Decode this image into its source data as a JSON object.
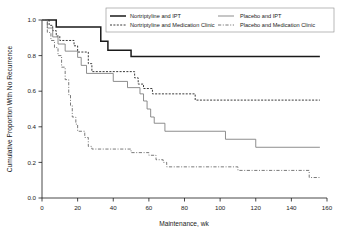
{
  "chart_data": {
    "type": "line",
    "subtype": "kaplan-meier-step",
    "title": "",
    "xlabel": "Maintenance, wk",
    "ylabel": "Cumulative Proportion With No Recurrence",
    "xlim": [
      0,
      160
    ],
    "ylim": [
      0.0,
      1.0
    ],
    "xticks": [
      0,
      20,
      40,
      60,
      80,
      100,
      120,
      140,
      160
    ],
    "xtick_labels": [
      "0",
      "20",
      "40",
      "60",
      "80",
      "100",
      "120",
      "140",
      "160"
    ],
    "yticks": [
      0.0,
      0.2,
      0.4,
      0.6,
      0.8,
      1.0
    ],
    "ytick_labels": [
      "0.0",
      "0.2",
      "0.4",
      "0.6",
      "0.8",
      "1.0"
    ],
    "grid": false,
    "legend_position": "top-center",
    "series": [
      {
        "name": "Nortriptyline and IPT",
        "style": "solid-thick",
        "color": "#1a1a1a",
        "points": [
          [
            0,
            1.0
          ],
          [
            8,
            1.0
          ],
          [
            8,
            0.96
          ],
          [
            33,
            0.96
          ],
          [
            33,
            0.88
          ],
          [
            37,
            0.88
          ],
          [
            37,
            0.83
          ],
          [
            50,
            0.83
          ],
          [
            50,
            0.795
          ],
          [
            156,
            0.795
          ]
        ]
      },
      {
        "name": "Nortriptyline and Medication Clinic",
        "style": "dotted",
        "color": "#3a3a3a",
        "points": [
          [
            0,
            1.0
          ],
          [
            4,
            1.0
          ],
          [
            4,
            0.97
          ],
          [
            6,
            0.97
          ],
          [
            6,
            0.94
          ],
          [
            8,
            0.94
          ],
          [
            8,
            0.91
          ],
          [
            10,
            0.91
          ],
          [
            10,
            0.885
          ],
          [
            18,
            0.885
          ],
          [
            18,
            0.855
          ],
          [
            20,
            0.855
          ],
          [
            20,
            0.82
          ],
          [
            26,
            0.82
          ],
          [
            26,
            0.755
          ],
          [
            28,
            0.755
          ],
          [
            28,
            0.71
          ],
          [
            52,
            0.71
          ],
          [
            52,
            0.675
          ],
          [
            54,
            0.675
          ],
          [
            54,
            0.64
          ],
          [
            57,
            0.64
          ],
          [
            57,
            0.615
          ],
          [
            62,
            0.615
          ],
          [
            62,
            0.585
          ],
          [
            86,
            0.585
          ],
          [
            86,
            0.55
          ],
          [
            156,
            0.55
          ]
        ]
      },
      {
        "name": "Placebo and IPT",
        "style": "solid-thin",
        "color": "#7a7a7a",
        "points": [
          [
            0,
            1.0
          ],
          [
            3,
            1.0
          ],
          [
            3,
            0.955
          ],
          [
            6,
            0.955
          ],
          [
            6,
            0.905
          ],
          [
            9,
            0.905
          ],
          [
            9,
            0.865
          ],
          [
            13,
            0.865
          ],
          [
            13,
            0.825
          ],
          [
            20,
            0.825
          ],
          [
            20,
            0.79
          ],
          [
            22,
            0.79
          ],
          [
            22,
            0.745
          ],
          [
            25,
            0.745
          ],
          [
            25,
            0.7
          ],
          [
            40,
            0.7
          ],
          [
            40,
            0.655
          ],
          [
            48,
            0.655
          ],
          [
            48,
            0.62
          ],
          [
            55,
            0.62
          ],
          [
            55,
            0.585
          ],
          [
            57,
            0.585
          ],
          [
            57,
            0.545
          ],
          [
            59,
            0.545
          ],
          [
            59,
            0.5
          ],
          [
            61,
            0.5
          ],
          [
            61,
            0.455
          ],
          [
            63,
            0.455
          ],
          [
            63,
            0.42
          ],
          [
            69,
            0.42
          ],
          [
            69,
            0.375
          ],
          [
            103,
            0.375
          ],
          [
            103,
            0.33
          ],
          [
            120,
            0.33
          ],
          [
            120,
            0.285
          ],
          [
            156,
            0.285
          ]
        ]
      },
      {
        "name": "Placebo and Medication Clinic",
        "style": "dash-dot",
        "color": "#6a6a6a",
        "points": [
          [
            0,
            1.0
          ],
          [
            3,
            1.0
          ],
          [
            3,
            0.93
          ],
          [
            5,
            0.93
          ],
          [
            5,
            0.885
          ],
          [
            7,
            0.885
          ],
          [
            7,
            0.845
          ],
          [
            9,
            0.845
          ],
          [
            9,
            0.8
          ],
          [
            11,
            0.8
          ],
          [
            11,
            0.735
          ],
          [
            13,
            0.735
          ],
          [
            13,
            0.665
          ],
          [
            15,
            0.665
          ],
          [
            15,
            0.58
          ],
          [
            16,
            0.58
          ],
          [
            16,
            0.52
          ],
          [
            17,
            0.52
          ],
          [
            17,
            0.455
          ],
          [
            19,
            0.455
          ],
          [
            19,
            0.415
          ],
          [
            20,
            0.415
          ],
          [
            20,
            0.375
          ],
          [
            24,
            0.375
          ],
          [
            24,
            0.34
          ],
          [
            26,
            0.34
          ],
          [
            26,
            0.29
          ],
          [
            28,
            0.29
          ],
          [
            28,
            0.275
          ],
          [
            50,
            0.275
          ],
          [
            50,
            0.255
          ],
          [
            60,
            0.255
          ],
          [
            60,
            0.24
          ],
          [
            64,
            0.24
          ],
          [
            64,
            0.215
          ],
          [
            68,
            0.215
          ],
          [
            68,
            0.2
          ],
          [
            70,
            0.2
          ],
          [
            70,
            0.175
          ],
          [
            110,
            0.175
          ],
          [
            110,
            0.155
          ],
          [
            150,
            0.155
          ],
          [
            150,
            0.115
          ],
          [
            156,
            0.115
          ]
        ]
      }
    ]
  },
  "legend": {
    "entries": [
      {
        "label": "Nortriptyline and IPT",
        "style": "solid-thick"
      },
      {
        "label": "Nortriptyline and Medication Clinic",
        "style": "dotted"
      },
      {
        "label": "Placebo and IPT",
        "style": "solid-thin"
      },
      {
        "label": "Placebo and Medication Clinic",
        "style": "dash-dot"
      }
    ]
  },
  "colors": {
    "axis": "#1a1a1a",
    "background": "#ffffff",
    "series_1": "#1a1a1a",
    "series_2": "#3a3a3a",
    "series_3": "#7a7a7a",
    "series_4": "#6a6a6a"
  }
}
